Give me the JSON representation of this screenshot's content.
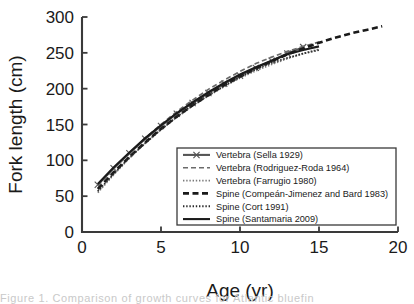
{
  "figure": {
    "background_color": "#ffffff",
    "axis_color": "#3a3a3a",
    "caption_fragment": "Figure 1. Comparison of growth curves for Atlantic bluefin"
  },
  "chart_data": {
    "type": "line",
    "title": "",
    "xlabel": "Age (yr)",
    "ylabel": "Fork length (cm)",
    "xlim": [
      0,
      20
    ],
    "ylim": [
      0,
      300
    ],
    "xticks": [
      0,
      5,
      10,
      15,
      20
    ],
    "yticks": [
      0,
      50,
      100,
      150,
      200,
      250,
      300
    ],
    "xtick_labels": [
      "0",
      "5",
      "10",
      "15",
      "20"
    ],
    "ytick_labels": [
      "0",
      "50",
      "100",
      "150",
      "200",
      "250",
      "300"
    ],
    "grid": false,
    "legend_position": "lower right",
    "series": [
      {
        "name": "Vertebra (Sella 1929)",
        "style": "solid-with-x-markers",
        "color": "#555555",
        "marker": "x",
        "x": [
          1,
          2,
          3,
          4,
          5,
          6,
          7,
          8,
          9,
          10,
          11,
          12,
          13,
          14
        ],
        "y": [
          66,
          89,
          110,
          130,
          148,
          165,
          180,
          194,
          207,
          218,
          229,
          239,
          249,
          258
        ]
      },
      {
        "name": "Vertebra (Rodriguez-Roda 1964)",
        "style": "dashed",
        "color": "#6b6b6b",
        "x": [
          1,
          2,
          3,
          4,
          5,
          6,
          7,
          8,
          9,
          10,
          11,
          12,
          13,
          14,
          15
        ],
        "y": [
          64,
          88,
          110,
          131,
          150,
          168,
          184,
          199,
          212,
          224,
          235,
          244,
          252,
          259,
          265
        ]
      },
      {
        "name": "Vertebra (Farrugio 1980)",
        "style": "dotted",
        "color": "#7a7a7a",
        "x": [
          1,
          2,
          3,
          4,
          5,
          6,
          7,
          8,
          9,
          10,
          11,
          12,
          13,
          14,
          15
        ],
        "y": [
          55,
          80,
          103,
          124,
          143,
          160,
          176,
          190,
          203,
          215,
          225,
          234,
          242,
          249,
          255
        ]
      },
      {
        "name": "Spine (Compeán-Jimenez and Bard 1983)",
        "style": "thick-dashed",
        "color": "#1a1a1a",
        "x": [
          1,
          2,
          3,
          4,
          5,
          6,
          7,
          8,
          9,
          10,
          11,
          12,
          13,
          14,
          15,
          16,
          17,
          18,
          19
        ],
        "y": [
          60,
          83,
          105,
          125,
          144,
          161,
          177,
          191,
          205,
          217,
          228,
          238,
          248,
          256,
          264,
          271,
          277,
          282,
          287
        ]
      },
      {
        "name": "Spine (Cort 1991)",
        "style": "dotted",
        "color": "#2a2a2a",
        "x": [
          1,
          2,
          3,
          4,
          5,
          6,
          7,
          8,
          9,
          10,
          11,
          12,
          13,
          14,
          15
        ],
        "y": [
          57,
          81,
          104,
          124,
          143,
          161,
          177,
          191,
          204,
          216,
          227,
          236,
          243,
          249,
          254
        ]
      },
      {
        "name": "Spine (Santamaria 2009)",
        "style": "solid",
        "color": "#1a1a1a",
        "x": [
          1,
          2,
          3,
          4,
          5,
          6,
          7,
          8,
          9,
          10,
          11,
          12,
          13,
          14,
          15
        ],
        "y": [
          67,
          90,
          111,
          131,
          149,
          166,
          181,
          195,
          208,
          220,
          230,
          239,
          248,
          254,
          259
        ]
      }
    ]
  },
  "legend": {
    "items": [
      {
        "label": "Vertebra (Sella 1929)",
        "style": "solid-with-x-markers"
      },
      {
        "label": "Vertebra (Rodriguez-Roda 1964)",
        "style": "dashed"
      },
      {
        "label": "Vertebra (Farrugio 1980)",
        "style": "dotted"
      },
      {
        "label": "Spine (Compeán-Jimenez and Bard 1983)",
        "style": "thick-dashed"
      },
      {
        "label": "Spine (Cort 1991)",
        "style": "dotted"
      },
      {
        "label": "Spine (Santamaria 2009)",
        "style": "solid"
      }
    ]
  }
}
